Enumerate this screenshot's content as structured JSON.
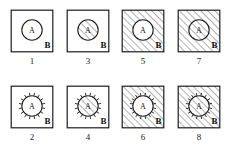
{
  "figure": {
    "type": "diagram",
    "colors": {
      "background": "#ffffff",
      "stroke": "#1d1d1d",
      "hatch": "#2a2a2a"
    },
    "inner_label": "A",
    "outer_label": "B",
    "hatch_angle_deg": 45,
    "layout": {
      "columns": 4,
      "rows": 2,
      "column_order": [
        "1,2",
        "3,4",
        "5,6",
        "7,8"
      ]
    },
    "panels": [
      {
        "caption": "1",
        "square_hatched": false,
        "circle_hatched": false,
        "boundary_ticks": false,
        "inner_label": "A",
        "outer_label": "B",
        "row": 0,
        "col": 0
      },
      {
        "caption": "3",
        "square_hatched": false,
        "circle_hatched": true,
        "boundary_ticks": false,
        "inner_label": "A",
        "outer_label": "B",
        "row": 0,
        "col": 1
      },
      {
        "caption": "5",
        "square_hatched": true,
        "circle_hatched": false,
        "boundary_ticks": false,
        "inner_label": "A",
        "outer_label": "B",
        "row": 0,
        "col": 2
      },
      {
        "caption": "7",
        "square_hatched": true,
        "circle_hatched": true,
        "boundary_ticks": false,
        "inner_label": "A",
        "outer_label": "B",
        "row": 0,
        "col": 3
      },
      {
        "caption": "2",
        "square_hatched": false,
        "circle_hatched": false,
        "boundary_ticks": true,
        "inner_label": "A",
        "outer_label": "B",
        "row": 1,
        "col": 0
      },
      {
        "caption": "4",
        "square_hatched": false,
        "circle_hatched": true,
        "boundary_ticks": true,
        "inner_label": "A",
        "outer_label": "B",
        "row": 1,
        "col": 1
      },
      {
        "caption": "6",
        "square_hatched": true,
        "circle_hatched": false,
        "boundary_ticks": true,
        "inner_label": "A",
        "outer_label": "B",
        "row": 1,
        "col": 2
      },
      {
        "caption": "8",
        "square_hatched": true,
        "circle_hatched": true,
        "boundary_ticks": true,
        "inner_label": "A",
        "outer_label": "B",
        "row": 1,
        "col": 3
      }
    ]
  }
}
